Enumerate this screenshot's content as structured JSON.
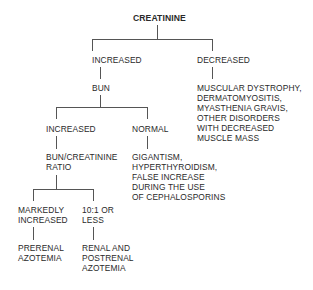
{
  "diagram": {
    "type": "decision-tree",
    "root": {
      "label": "CREATININE"
    },
    "nodes": {
      "creatinine_increased": {
        "lines": [
          "INCREASED"
        ]
      },
      "creatinine_decreased": {
        "lines": [
          "DECREASED"
        ]
      },
      "bun": {
        "lines": [
          "BUN"
        ]
      },
      "decreased_causes": {
        "lines": [
          "MUSCULAR DYSTROPHY,",
          "DERMATOMYOSITIS,",
          "MYASTHENIA GRAVIS,",
          "OTHER DISORDERS",
          "WITH DECREASED",
          "MUSCLE MASS"
        ]
      },
      "bun_increased": {
        "lines": [
          "INCREASED"
        ]
      },
      "bun_normal": {
        "lines": [
          "NORMAL"
        ]
      },
      "bun_creatinine_ratio": {
        "lines": [
          "BUN/CREATININE",
          "RATIO"
        ]
      },
      "normal_causes": {
        "lines": [
          "GIGANTISM,",
          "HYPERTHYROIDISM,",
          "FALSE INCREASE",
          "DURING THE USE",
          "OF CEPHALOSPORINS"
        ]
      },
      "ratio_markedly_increased": {
        "lines": [
          "MARKEDLY",
          "INCREASED"
        ]
      },
      "ratio_10_1_or_less": {
        "lines": [
          "10:1 OR",
          "LESS"
        ]
      },
      "prerenal": {
        "lines": [
          "PRERENAL",
          "AZOTEMIA"
        ]
      },
      "renal_postrenal": {
        "lines": [
          "RENAL AND",
          "POSTRENAL",
          "AZOTEMIA"
        ]
      }
    },
    "edges": [
      [
        "CREATININE",
        "INCREASED"
      ],
      [
        "CREATININE",
        "DECREASED"
      ],
      [
        "INCREASED",
        "BUN"
      ],
      [
        "DECREASED",
        "MUSCULAR DYSTROPHY, DERMATOMYOSITIS, MYASTHENIA GRAVIS, OTHER DISORDERS WITH DECREASED MUSCLE MASS"
      ],
      [
        "BUN",
        "INCREASED"
      ],
      [
        "BUN",
        "NORMAL"
      ],
      [
        "INCREASED",
        "BUN/CREATININE RATIO"
      ],
      [
        "NORMAL",
        "GIGANTISM, HYPERTHYROIDISM, FALSE INCREASE DURING THE USE OF CEPHALOSPORINS"
      ],
      [
        "BUN/CREATININE RATIO",
        "MARKEDLY INCREASED"
      ],
      [
        "BUN/CREATININE RATIO",
        "10:1 OR LESS"
      ],
      [
        "MARKEDLY INCREASED",
        "PRERENAL AZOTEMIA"
      ],
      [
        "10:1 OR LESS",
        "RENAL AND POSTRENAL AZOTEMIA"
      ]
    ]
  }
}
